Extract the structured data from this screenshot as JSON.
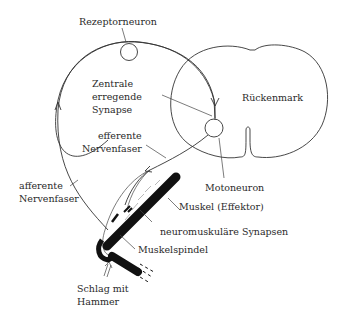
{
  "diagram": {
    "type": "reflex-arc",
    "labels": {
      "receptor_neuron": "Rezeptorneuron",
      "spinal_cord": "Rückenmark",
      "central_synapse_1": "Zentrale",
      "central_synapse_2": "erregende",
      "central_synapse_3": "Synapse",
      "efferent_1": "efferente",
      "efferent_2": "Nervenfaser",
      "afferent_1": "afferente",
      "afferent_2": "Nervenfaser",
      "motoneuron": "Motoneuron",
      "muscle": "Muskel (Effektor)",
      "nmj": "neuromuskuläre Synapsen",
      "spindle": "Muskelspindel",
      "hammer_1": "Schlag mit",
      "hammer_2": "Hammer"
    },
    "colors": {
      "line": "#333333",
      "bone": "#111111",
      "background": "#ffffff"
    }
  }
}
